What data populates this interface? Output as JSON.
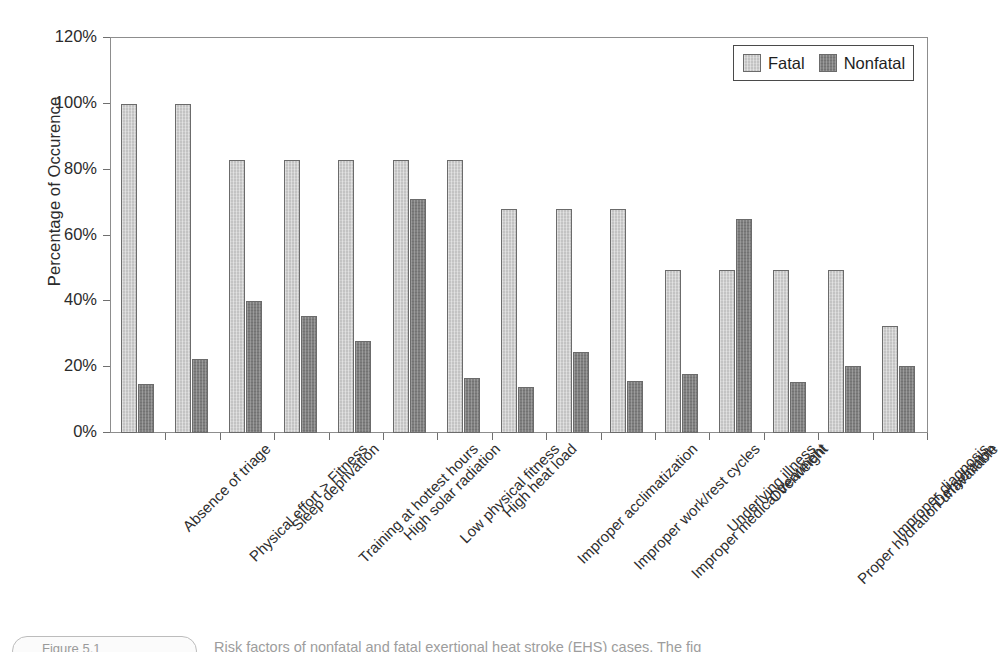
{
  "chart_data": {
    "type": "bar",
    "title": "",
    "subtitle": "",
    "xlabel": "",
    "ylabel": "Percentage of Occurence",
    "ylim": [
      0,
      120
    ],
    "ytick_labels": [
      "120%",
      "100%",
      "80%",
      "60%",
      "40%",
      "20%",
      "0%"
    ],
    "ytick_values": [
      120,
      100,
      80,
      60,
      40,
      20,
      0
    ],
    "grid": false,
    "legend_position": "top-right",
    "categories": [
      "Absence of triage",
      "Physical effort > Fitness",
      "Sleep deprivation",
      "Training at hottest hours",
      "High solar radiation",
      "Low physical fitness",
      "High heat load",
      "Improper acclimatization",
      "Improper work/rest cycles",
      "Improper medical treatment",
      "Underlying illness",
      "Overweight",
      "Proper hydration unavailable",
      "Improper diagnosis",
      "Dehydration"
    ],
    "series": [
      {
        "name": "Fatal",
        "color": "#c3c3c3",
        "values": [
          100,
          100,
          83,
          83,
          83,
          83,
          83,
          68,
          68,
          68,
          49.5,
          49.5,
          49.5,
          49.5,
          32.5
        ]
      },
      {
        "name": "Nonfatal",
        "color": "#7f7f7f",
        "values": [
          15,
          22.5,
          40,
          35.5,
          28,
          71,
          16.8,
          14,
          24.5,
          15.8,
          17.8,
          65,
          15.6,
          20.5,
          20.3
        ]
      }
    ]
  },
  "legend": {
    "entries": [
      {
        "label": "Fatal",
        "swatch": "light-gray-swatch"
      },
      {
        "label": "Nonfatal",
        "swatch": "dark-gray-swatch"
      }
    ]
  },
  "caption": {
    "badge_label": "Figure 5.1",
    "text": "Risk factors of nonfatal and fatal exertional heat stroke (EHS) cases. The fig"
  }
}
